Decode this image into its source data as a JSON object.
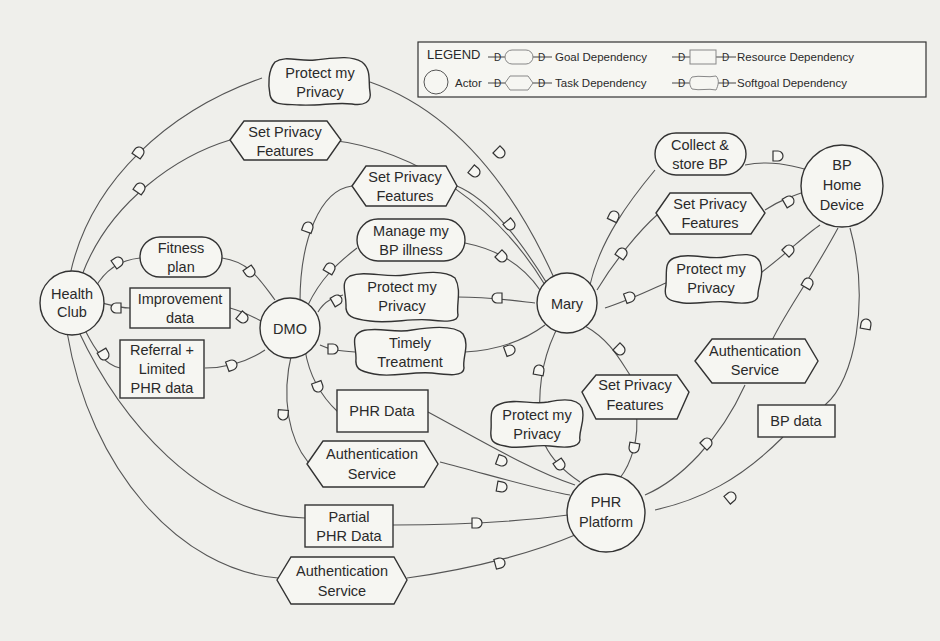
{
  "legend": {
    "title": "LEGEND",
    "actor": "Actor",
    "goal": "Goal Dependency",
    "task": "Task Dependency",
    "resource": "Resource Dependency",
    "softgoal": "Softgoal Dependency",
    "dependency_mark": "D"
  },
  "actors": {
    "health_club": [
      "Health",
      "Club"
    ],
    "dmo": [
      "DMO"
    ],
    "mary": [
      "Mary"
    ],
    "bp_home_device": [
      "BP",
      "Home",
      "Device"
    ],
    "phr_platform": [
      "PHR",
      "Platform"
    ]
  },
  "dependums": {
    "hc_mary_softgoal": {
      "type": "softgoal",
      "lines": [
        "Protect my",
        "Privacy"
      ]
    },
    "hc_mary_task": {
      "type": "task",
      "lines": [
        "Set Privacy",
        "Features"
      ]
    },
    "hc_dmo_goal": {
      "type": "goal",
      "lines": [
        "Fitness",
        "plan"
      ]
    },
    "hc_dmo_resource1": {
      "type": "resource",
      "lines": [
        "Improvement",
        "data"
      ]
    },
    "hc_dmo_resource2": {
      "type": "resource",
      "lines": [
        "Referral +",
        "Limited",
        "PHR data"
      ]
    },
    "dmo_mary_task": {
      "type": "task",
      "lines": [
        "Set Privacy",
        "Features"
      ]
    },
    "dmo_mary_goal": {
      "type": "goal",
      "lines": [
        "Manage my",
        "BP illness"
      ]
    },
    "dmo_mary_softgoal1": {
      "type": "softgoal",
      "lines": [
        "Protect my",
        "Privacy"
      ]
    },
    "dmo_mary_softgoal2": {
      "type": "softgoal",
      "lines": [
        "Timely",
        "Treatment"
      ]
    },
    "dmo_phr_resource": {
      "type": "resource",
      "lines": [
        "PHR Data"
      ]
    },
    "dmo_phr_task": {
      "type": "task",
      "lines": [
        "Authentication",
        "Service"
      ]
    },
    "hc_phr_resource": {
      "type": "resource",
      "lines": [
        "Partial",
        "PHR Data"
      ]
    },
    "hc_phr_task": {
      "type": "task",
      "lines": [
        "Authentication",
        "Service"
      ]
    },
    "mary_bp_goal": {
      "type": "goal",
      "lines": [
        "Collect &",
        "store BP"
      ]
    },
    "mary_bp_task": {
      "type": "task",
      "lines": [
        "Set Privacy",
        "Features"
      ]
    },
    "mary_bp_softgoal": {
      "type": "softgoal",
      "lines": [
        "Protect my",
        "Privacy"
      ]
    },
    "mary_phr_softgoal": {
      "type": "softgoal",
      "lines": [
        "Protect my",
        "Privacy"
      ]
    },
    "mary_phr_task": {
      "type": "task",
      "lines": [
        "Set Privacy",
        "Features"
      ]
    },
    "bp_phr_task": {
      "type": "task",
      "lines": [
        "Authentication",
        "Service"
      ]
    },
    "bp_phr_resource": {
      "type": "resource",
      "lines": [
        "BP data"
      ]
    }
  },
  "colors": {
    "background": "#efefeb",
    "stroke": "#333333",
    "text": "#2a2a2a"
  }
}
